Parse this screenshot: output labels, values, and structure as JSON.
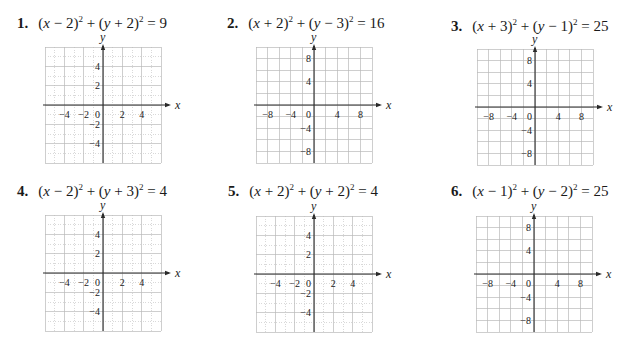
{
  "page": {
    "problems": [
      {
        "number": "1.",
        "equation_parts": [
          "(",
          "x",
          " − 2)",
          "2",
          " + (",
          "y",
          " + 2)",
          "2",
          " = 9"
        ],
        "equation": "(x − 2)² + (y + 2)² = 9",
        "graph": {
          "x_label": "x",
          "y_label": "y",
          "range": [
            -6,
            6
          ],
          "minor_step": 1,
          "major_step": 2,
          "x_ticks": [
            "−4",
            "−2",
            "0",
            "2",
            "4"
          ],
          "x_tick_values": [
            -4,
            -2,
            0,
            2,
            4
          ],
          "y_ticks": [
            "4",
            "2",
            "−2",
            "−4"
          ],
          "y_tick_values": [
            4,
            2,
            -2,
            -4
          ]
        }
      },
      {
        "number": "2.",
        "equation_parts": [
          "(",
          "x",
          " + 2)",
          "2",
          " + (",
          "y",
          " − 3)",
          "2",
          " = 16"
        ],
        "equation": "(x + 2)² + (y − 3)² = 16",
        "graph": {
          "x_label": "x",
          "y_label": "y",
          "range": [
            -10,
            10
          ],
          "minor_step": 2,
          "major_step": 2,
          "x_ticks": [
            "−8",
            "−4",
            "0",
            "4",
            "8"
          ],
          "x_tick_values": [
            -8,
            -4,
            0,
            4,
            8
          ],
          "y_ticks": [
            "8",
            "4",
            "−4",
            "−8"
          ],
          "y_tick_values": [
            8,
            4,
            -4,
            -8
          ]
        }
      },
      {
        "number": "3.",
        "equation_parts": [
          "(",
          "x",
          " + 3)",
          "2",
          " + (",
          "y",
          " − 1)",
          "2",
          " = 25"
        ],
        "equation": "(x + 3)² + (y − 1)² = 25",
        "graph": {
          "x_label": "x",
          "y_label": "y",
          "range": [
            -10,
            10
          ],
          "minor_step": 2,
          "major_step": 2,
          "x_ticks": [
            "−8",
            "−4",
            "0",
            "4",
            "8"
          ],
          "x_tick_values": [
            -8,
            -4,
            0,
            4,
            8
          ],
          "y_ticks": [
            "8",
            "4",
            "−4",
            "−8"
          ],
          "y_tick_values": [
            8,
            4,
            -4,
            -8
          ]
        }
      },
      {
        "number": "4.",
        "equation_parts": [
          "(",
          "x",
          " − 2)",
          "2",
          " + (",
          "y",
          " + 3)",
          "2",
          " = 4"
        ],
        "equation": "(x − 2)² + (y + 3)² = 4",
        "graph": {
          "x_label": "x",
          "y_label": "y",
          "range": [
            -6,
            6
          ],
          "minor_step": 1,
          "major_step": 2,
          "x_ticks": [
            "−4",
            "−2",
            "0",
            "2",
            "4"
          ],
          "x_tick_values": [
            -4,
            -2,
            0,
            2,
            4
          ],
          "y_ticks": [
            "4",
            "2",
            "−2",
            "−4"
          ],
          "y_tick_values": [
            4,
            2,
            -2,
            -4
          ]
        }
      },
      {
        "number": "5.",
        "equation_parts": [
          "(",
          "x",
          " + 2)",
          "2",
          " + (",
          "y",
          " + 2)",
          "2",
          " = 4"
        ],
        "equation": "(x + 2)² + (y + 2)² = 4",
        "graph": {
          "x_label": "x",
          "y_label": "y",
          "range": [
            -6,
            6
          ],
          "minor_step": 1,
          "major_step": 2,
          "x_ticks": [
            "−4",
            "−2",
            "0",
            "2",
            "4"
          ],
          "x_tick_values": [
            -4,
            -2,
            0,
            2,
            4
          ],
          "y_ticks": [
            "4",
            "2",
            "−2",
            "−4"
          ],
          "y_tick_values": [
            4,
            2,
            -2,
            -4
          ]
        }
      },
      {
        "number": "6.",
        "equation_parts": [
          "(",
          "x",
          " − 1)",
          "2",
          " + (",
          "y",
          " − 2)",
          "2",
          " = 25"
        ],
        "equation": "(x − 1)² + (y − 2)² = 25",
        "graph": {
          "x_label": "x",
          "y_label": "y",
          "range": [
            -10,
            10
          ],
          "minor_step": 2,
          "major_step": 2,
          "x_ticks": [
            "−8",
            "−4",
            "0",
            "4",
            "8"
          ],
          "x_tick_values": [
            -8,
            -4,
            0,
            4,
            8
          ],
          "y_ticks": [
            "8",
            "4",
            "−4",
            "−8"
          ],
          "y_tick_values": [
            8,
            4,
            -4,
            -8
          ]
        }
      }
    ]
  },
  "colors": {
    "axis": "#2a2a2a",
    "grid_major": "#b9b9b9",
    "grid_minor": "#cfcfcf",
    "text": "#1a1a1a"
  }
}
